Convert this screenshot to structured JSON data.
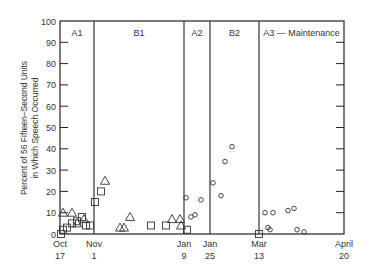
{
  "chart_data": {
    "type": "scatter",
    "title": "",
    "ylabel_line1": "Percent of 56 Fifteen–Second Units",
    "ylabel_line2": "in Which Speech Occurred",
    "xlabel": "",
    "ylim": [
      0,
      100
    ],
    "yticks": [
      0,
      10,
      20,
      30,
      40,
      50,
      60,
      70,
      80,
      90,
      100
    ],
    "grid": false,
    "legend": null,
    "xticks": [
      {
        "label1": "Oct",
        "label2": "17",
        "x": 0
      },
      {
        "label1": "Nov",
        "label2": "1",
        "x": 34
      },
      {
        "label1": "Jan",
        "label2": "9",
        "x": 124
      },
      {
        "label1": "Jan",
        "label2": "25",
        "x": 150
      },
      {
        "label1": "Mar",
        "label2": "13",
        "x": 199
      },
      {
        "label1": "April",
        "label2": "20",
        "x": 284
      }
    ],
    "phases": [
      {
        "label": "A1",
        "x_start": 0,
        "x_end": 34
      },
      {
        "label": "B1",
        "x_start": 34,
        "x_end": 124
      },
      {
        "label": "A2",
        "x_start": 124,
        "x_end": 150
      },
      {
        "label": "B2",
        "x_start": 150,
        "x_end": 199
      },
      {
        "label": "A3 — Maintenance",
        "x_start": 199,
        "x_end": 284
      }
    ],
    "series": [
      {
        "name": "triangle",
        "marker": "triangle",
        "points": [
          [
            3,
            10
          ],
          [
            12,
            10
          ],
          [
            17,
            5
          ],
          [
            24,
            7
          ],
          [
            45,
            25
          ],
          [
            60,
            3
          ],
          [
            64,
            3
          ],
          [
            70,
            8
          ],
          [
            112,
            7
          ],
          [
            120,
            7
          ],
          [
            121,
            4
          ]
        ]
      },
      {
        "name": "square",
        "marker": "square",
        "points": [
          [
            1,
            0
          ],
          [
            3,
            2
          ],
          [
            7,
            3
          ],
          [
            12,
            5
          ],
          [
            17,
            6
          ],
          [
            22,
            8
          ],
          [
            26,
            4
          ],
          [
            30,
            4
          ],
          [
            35,
            15
          ],
          [
            41,
            20
          ],
          [
            91,
            4
          ],
          [
            106,
            4
          ],
          [
            127,
            2
          ],
          [
            199,
            0
          ]
        ]
      },
      {
        "name": "circle",
        "marker": "circle",
        "points": [
          [
            126,
            17
          ],
          [
            131,
            8
          ],
          [
            135,
            9
          ],
          [
            141,
            16
          ],
          [
            153,
            24
          ],
          [
            161,
            18
          ],
          [
            165,
            34
          ],
          [
            172,
            41
          ],
          [
            205,
            10
          ],
          [
            208,
            3
          ],
          [
            210,
            2
          ],
          [
            213,
            10
          ],
          [
            228,
            11
          ],
          [
            234,
            12
          ],
          [
            237,
            2
          ],
          [
            244,
            1
          ]
        ]
      }
    ]
  }
}
